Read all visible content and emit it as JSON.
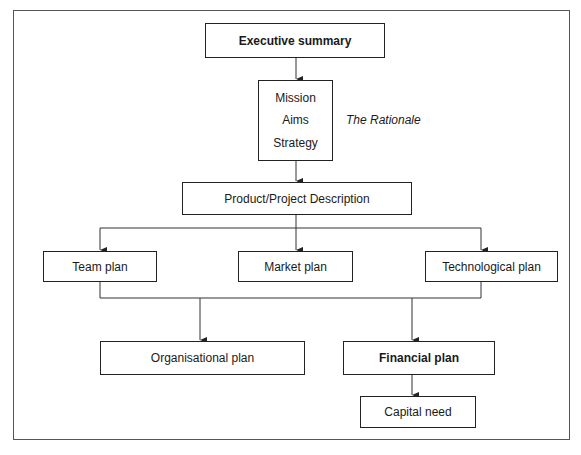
{
  "diagram": {
    "nodes": {
      "executive_summary": {
        "label": "Executive summary",
        "bold": true
      },
      "rationale_box": {
        "items": [
          "Mission",
          "Aims",
          "Strategy"
        ]
      },
      "rationale_note": {
        "label": "The Rationale"
      },
      "product_description": {
        "label": "Product/Project Description"
      },
      "team_plan": {
        "label": "Team plan"
      },
      "market_plan": {
        "label": "Market plan"
      },
      "technological_plan": {
        "label": "Technological plan"
      },
      "organisational_plan": {
        "label": "Organisational plan"
      },
      "financial_plan": {
        "label": "Financial plan",
        "bold": true
      },
      "capital_need": {
        "label": "Capital need"
      }
    },
    "edges": [
      [
        "executive_summary",
        "rationale_box"
      ],
      [
        "rationale_box",
        "product_description"
      ],
      [
        "product_description",
        "team_plan"
      ],
      [
        "product_description",
        "market_plan"
      ],
      [
        "product_description",
        "technological_plan"
      ],
      [
        "team_plan",
        "organisational_plan"
      ],
      [
        "technological_plan",
        "organisational_plan"
      ],
      [
        "team_plan",
        "financial_plan"
      ],
      [
        "technological_plan",
        "financial_plan"
      ],
      [
        "financial_plan",
        "capital_need"
      ]
    ]
  }
}
